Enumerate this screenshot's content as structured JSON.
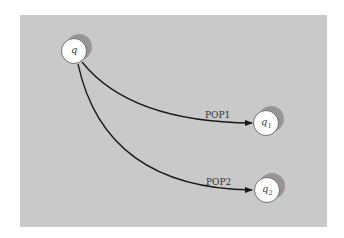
{
  "diagram": {
    "type": "state-transition",
    "background_color": "#c9c9c9",
    "nodes": [
      {
        "id": "q",
        "label": "q",
        "subscript": ""
      },
      {
        "id": "q1",
        "label": "q",
        "subscript": "1"
      },
      {
        "id": "q2",
        "label": "q",
        "subscript": "2"
      }
    ],
    "edges": [
      {
        "from": "q",
        "to": "q1",
        "label": "POP1"
      },
      {
        "from": "q",
        "to": "q2",
        "label": "POP2"
      }
    ]
  }
}
